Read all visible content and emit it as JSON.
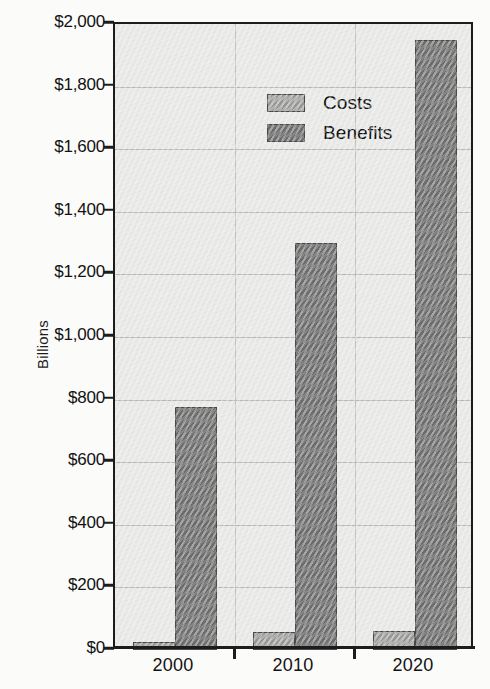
{
  "chart_data": {
    "type": "bar",
    "title": "",
    "subtitle": "",
    "xlabel": "",
    "ylabel": "Billions",
    "categories": [
      "2000",
      "2010",
      "2020"
    ],
    "series": [
      {
        "name": "Costs",
        "values": [
          25,
          57,
          62
        ],
        "color": "#9d9d9b"
      },
      {
        "name": "Benefits",
        "values": [
          775,
          1300,
          1950
        ],
        "color": "#737373"
      }
    ],
    "ylim": [
      0,
      2000
    ],
    "ytick_values": [
      0,
      200,
      400,
      600,
      800,
      1000,
      1200,
      1400,
      1600,
      1800,
      2000
    ],
    "ytick_labels": [
      "$0",
      "$200",
      "$400",
      "$600",
      "$800",
      "$1,000",
      "$1,200",
      "$1,400",
      "$1,600",
      "$1,800",
      "$2,000"
    ],
    "grid": true,
    "grid_axis": "both",
    "legend_position": "top-left",
    "legend_entries": [
      "Costs",
      "Benefits"
    ],
    "plot_background": "#e9e9e7",
    "axis_color": "#1c1c1c",
    "gridline_color": "#b9b9b7"
  },
  "axes": {
    "y_title": "Billions"
  }
}
